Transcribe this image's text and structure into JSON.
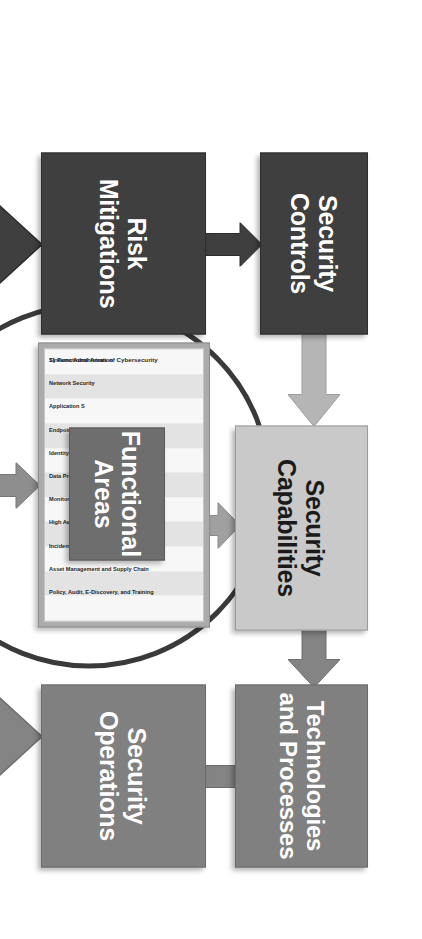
{
  "diagram": {
    "orientation": "rotated-90",
    "colors": {
      "dark": "#3f3f3f",
      "mid": "#808080",
      "light": "#c9c9c9",
      "center": "#6e6e6e",
      "ring": "#3a3a3a",
      "burst_fill": "#d9d9d9",
      "panel": "#ababab"
    },
    "blocks": {
      "security_controls": "Security Controls",
      "risk_mitigations": "Risk Mitigations",
      "security_capabilities": "Security Capabilities",
      "technologies_and_processes": "Technologies and Processes",
      "security_operations": "Security Operations",
      "functional_areas": "Functional Areas",
      "assessment": "Cybersecurity Program Assessment"
    },
    "functional_areas_panel": {
      "title": "11 Functional Areas of Cybersecurity",
      "items": [
        "Systems Administration",
        "Network Security",
        "Application S",
        "Endpoint, Se",
        "Identity, Aut",
        "Data Protect",
        "Monitoring, V",
        "High Availab",
        "Incident Response",
        "Asset Management and Supply Chain",
        "Policy, Audit, E-Discovery, and Training"
      ]
    },
    "arrows": [
      {
        "name": "risk-mitigations-to-security-controls",
        "from": "Risk Mitigations",
        "to": "Security Controls",
        "color": "#3f3f3f"
      },
      {
        "name": "security-controls-to-security-capabilities",
        "from": "Security Controls",
        "to": "Security Capabilities",
        "color": "#b0b0b0"
      },
      {
        "name": "security-capabilities-to-technologies",
        "from": "Security Capabilities",
        "to": "Technologies and Processes",
        "color": "#808080"
      },
      {
        "name": "functional-areas-to-security-capabilities",
        "from": "Functional Areas",
        "to": "Security Capabilities",
        "color": "#9e9e9e"
      },
      {
        "name": "security-operations-to-technologies",
        "from": "Security Operations",
        "to": "Technologies and Processes",
        "color": "#808080"
      },
      {
        "name": "assessment-to-risk-mitigations",
        "from": "Cybersecurity Program Assessment",
        "to": "Risk Mitigations",
        "color": "#3f3f3f"
      },
      {
        "name": "assessment-to-functional-areas",
        "from": "Cybersecurity Program Assessment",
        "to": "Functional Areas",
        "color": "#6e6e6e"
      },
      {
        "name": "assessment-to-security-operations",
        "from": "Cybersecurity Program Assessment",
        "to": "Security Operations",
        "color": "#808080"
      }
    ]
  }
}
